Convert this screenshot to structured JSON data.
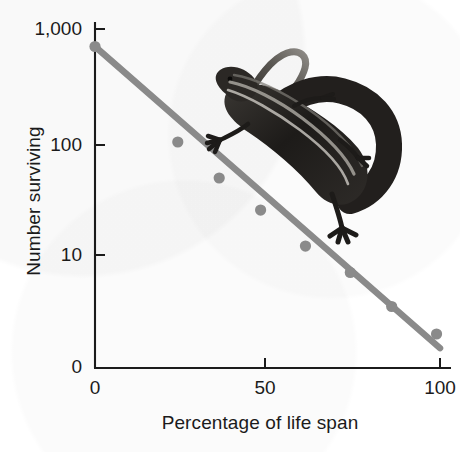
{
  "chart_data": {
    "type": "scatter",
    "title": "",
    "subtitle": "",
    "xlabel": "Percentage of life span",
    "ylabel": "Number surviving",
    "xlim": [
      0,
      100
    ],
    "ylim": [
      1,
      1000
    ],
    "yscale": "log",
    "xscale": "linear",
    "grid": false,
    "legend": null,
    "x_ticks": [
      0,
      50,
      100
    ],
    "x_tick_labels": [
      "0",
      "50",
      "100"
    ],
    "y_ticks": [
      1000,
      100,
      10,
      0
    ],
    "y_tick_labels": [
      "1,000",
      "100",
      "10",
      "0"
    ],
    "y_axis_break_at_zero": true,
    "series": [
      {
        "name": "Survivorship data",
        "kind": "scatter",
        "marker": "circle",
        "color": "#8a8a8a",
        "x": [
          0,
          24,
          36,
          48,
          61,
          74,
          86,
          99
        ],
        "y": [
          700,
          100,
          48,
          25,
          12,
          7,
          3.5,
          2
        ]
      },
      {
        "name": "Fitted survivorship line",
        "kind": "line",
        "color": "#8a8a8a",
        "x": [
          0,
          100
        ],
        "y": [
          700,
          1.5
        ]
      }
    ],
    "annotations": [
      {
        "name": "lizard-illustration",
        "label": "Striped skink lizard photograph",
        "x_px": 190,
        "y_px": 36,
        "width_px": 262,
        "height_px": 222
      }
    ]
  },
  "axes": {
    "y_label": "Number surviving",
    "x_label": "Percentage of life span",
    "y_tick_labels": [
      "1,000",
      "100",
      "10",
      "0"
    ],
    "x_tick_labels": [
      "0",
      "50",
      "100"
    ]
  },
  "colors": {
    "data": "#8a8a8a",
    "line": "#8a8a8a",
    "axis": "#1b1b1b",
    "text": "#1b1b1b",
    "background": "#ffffff"
  }
}
